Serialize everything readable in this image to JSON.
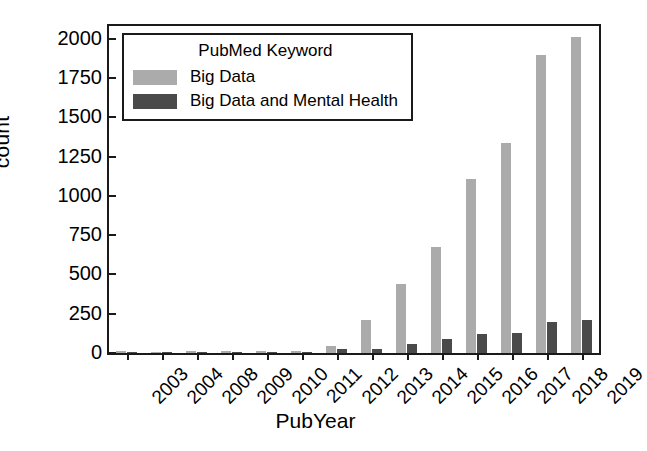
{
  "chart_data": {
    "type": "bar",
    "title": "",
    "xlabel": "PubYear",
    "ylabel": "count",
    "categories": [
      "2003",
      "2004",
      "2008",
      "2009",
      "2010",
      "2011",
      "2012",
      "2013",
      "2014",
      "2015",
      "2016",
      "2017",
      "2018",
      "2019"
    ],
    "series": [
      {
        "name": "Big Data",
        "color": "#ababab",
        "values": [
          12,
          5,
          15,
          14,
          12,
          12,
          45,
          208,
          437,
          672,
          1108,
          1335,
          1893,
          2010
        ]
      },
      {
        "name": "Big Data and Mental Health",
        "color": "#4a4a4a",
        "values": [
          6,
          2,
          3,
          4,
          4,
          5,
          25,
          28,
          60,
          88,
          118,
          130,
          195,
          208
        ]
      }
    ],
    "ylim": [
      0,
      2080
    ],
    "yticks": [
      0,
      250,
      500,
      750,
      1000,
      1250,
      1500,
      1750,
      2000
    ],
    "ytick_labels": [
      "0",
      "250",
      "500",
      "750",
      "1000",
      "1250",
      "1500",
      "1750",
      "2000"
    ],
    "grid": false,
    "legend": {
      "position": "upper left",
      "title": "PubMed Keyword",
      "entries": [
        "Big Data",
        "Big Data and Mental Health"
      ]
    }
  },
  "colors": {
    "axis": "#1a1a1a",
    "background": "#ffffff",
    "series_big_data": "#ababab",
    "series_big_data_mental_health": "#4a4a4a"
  }
}
